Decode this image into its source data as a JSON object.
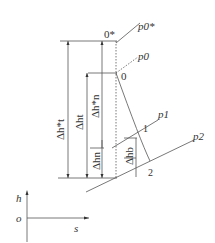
{
  "diagram": {
    "points": {
      "p0_star": "0*",
      "p0": "0",
      "p1pt": "1",
      "p2pt": "2"
    },
    "isobars": {
      "p0_star": "p0*",
      "p0": "p0",
      "p1": "p1",
      "p2": "p2"
    },
    "dims": {
      "dht_star": "Δh*t",
      "dht": "Δht",
      "dhn_star": "Δh*n",
      "dhn": "Δhn",
      "dhb": "Δhb"
    },
    "axes": {
      "y": "h",
      "x": "s",
      "origin": "o"
    }
  }
}
